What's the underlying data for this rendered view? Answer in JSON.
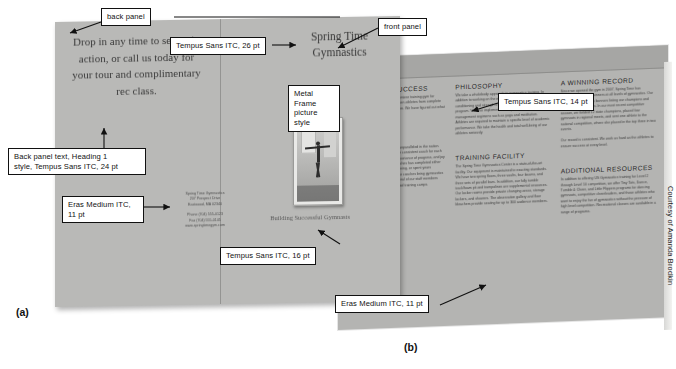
{
  "figure": {
    "label_a": "(a)",
    "label_b": "(b)",
    "credit": "Courtesy of Amanda Brodkin"
  },
  "callouts": [
    {
      "name": "back-panel",
      "text": "back panel"
    },
    {
      "name": "front-panel",
      "text": "front panel"
    },
    {
      "name": "title-font",
      "text": "Tempus Sans ITC, 26 pt"
    },
    {
      "name": "picture-style",
      "text": "Metal Frame\npicture style"
    },
    {
      "name": "back-panel-text",
      "text": "Back panel text, Heading 1\nstyle, Tempus Sans ITC, 24 pt"
    },
    {
      "name": "address-font",
      "text": "Eras Medium ITC,\n11 pt"
    },
    {
      "name": "tagline-font",
      "text": "Tempus Sans ITC, 16 pt"
    },
    {
      "name": "heading-font",
      "text": "Tempus Sans ITC, 14 pt"
    },
    {
      "name": "body-font",
      "text": "Eras Medium ITC, 11 pt"
    }
  ],
  "brochure_outside": {
    "back_panel_text": "Drop in any time to see us in action, or call us today for your tour and complimentary rec class.",
    "address": {
      "org": "Spring Time Gymnastics",
      "street": "207 Prospect Drive",
      "citystate": "Eastwood, MA 02340",
      "phone": "Phone (704) 555-0123",
      "fax": "Fax (704) 555-0145",
      "web": "www.springtimegym.com"
    },
    "front_title": "Spring Time Gymnastics",
    "tagline": "Building Successful Gymnasts"
  },
  "brochure_inside": {
    "columns": [
      {
        "sections": [
          {
            "heading": "A CULTURE SUCCESS",
            "body": "Spring Time Gymnastics is a premiere training gym for athletes of all ages. We have taken athletes from complete beginners to the top of the podium. We have figured out what makes Spring Time special."
          },
          {
            "heading": "OUR STAFF",
            "body": "Our talented staff of coaches is unparalleled in the nation. Consisting of a number of former consistent coach for each skill level, we understand the importance of progress, and joy of training. Every one of our coaches has completed either some form of collegiate level training, or spent years competing. We have certified Our coaches bring gymnastics training programs together. Several of our staff members participate in nationally sanctioned training camps."
          }
        ]
      },
      {
        "sections": [
          {
            "heading": "PHILOSOPHY",
            "body": "We take a wholebody approach to gymnastics training. In addition to working on the equipment, we require athletic conditioning and strength training as core components of the program. We also implement healthy eating and stress management regimens such as yoga and meditation. Athletes are required to maintain a specific level of academic performance. We take the health and total well-being of our athletes seriously."
          },
          {
            "heading": "TRAINING FACILITY",
            "body": "The Spring Time Gymnastics Center is a state-of-the-art facility. Our equipment is maintained to exacting standards. We have two spring floors, three vaults, four beams, and three sets of parallel bars. In addition, our fully tumble track/foam pit and trampolines are supplemental resources. Our locker rooms provide private changing areas, storage lockers, and showers. The observation gallery and floor bleachers provide seating for up to 300 audience members."
          }
        ]
      },
      {
        "sections": [
          {
            "heading": "A WINNING RECORD",
            "body": "Since we opened the gym in 2007, Spring Time has produced dozens of winners at all levels of gymnastics. Our facility is covered with banners listing our champions and their accomplishments. In our most recent competitive season, we fielded 12 state champions, placed four gymnasts in regional meets, and sent one athlete to the national competition, where she placed in the top three in two events."
          },
          {
            "heading": "",
            "body": "Our record is consistent. We work as hard as the athletes to ensure success at every level."
          },
          {
            "heading": "ADDITIONAL RESOURCES",
            "body": "In addition to offering US Gymnastics training for Level 2 through Level 10 competition, we offer Tiny Tots, Dance, Tumble & Cheer, and Little Flippers programs for dancing gymnasts, competitive cheerleaders, and those athletes who want to enjoy the fun of gymnastics without the pressure of high level competition. Recreational classes are available in a range of programs."
          }
        ]
      }
    ]
  },
  "colors": {
    "panel_a": "#b9b9b7",
    "panel_b": "#b4b4b2",
    "callout_border": "#111111",
    "page_bg": "#ffffff"
  }
}
